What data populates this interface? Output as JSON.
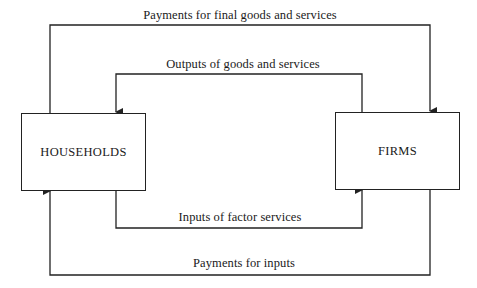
{
  "diagram": {
    "nodes": {
      "households": {
        "label": "HOUSEHOLDS"
      },
      "firms": {
        "label": "FIRMS"
      }
    },
    "flows": [
      {
        "id": "payments-final-goods",
        "label": "Payments for final goods and services",
        "from": "households",
        "to": "firms",
        "position": "outer-top"
      },
      {
        "id": "outputs-goods",
        "label": "Outputs of goods and services",
        "from": "firms",
        "to": "households",
        "position": "inner-top"
      },
      {
        "id": "inputs-factor",
        "label": "Inputs of factor services",
        "from": "households",
        "to": "firms",
        "position": "inner-bottom"
      },
      {
        "id": "payments-inputs",
        "label": "Payments for inputs",
        "from": "firms",
        "to": "households",
        "position": "outer-bottom"
      }
    ],
    "colors": {
      "line": "#222222",
      "background": "#ffffff"
    }
  }
}
